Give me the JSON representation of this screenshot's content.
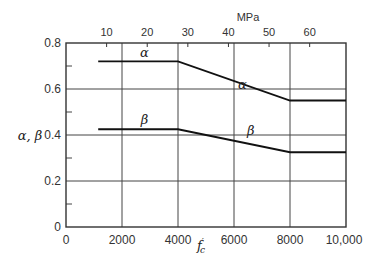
{
  "chart_data": {
    "type": "line",
    "title": "",
    "xlabel": "f'c",
    "ylabel": "α, β",
    "top_axis_label": "MPa",
    "xlim": [
      0,
      10000
    ],
    "ylim": [
      0,
      0.8
    ],
    "grid": true,
    "x_ticks": [
      "0",
      "2000",
      "4000",
      "6000",
      "8000",
      "10,000"
    ],
    "y_ticks": [
      "0",
      "0.2",
      "0.4",
      "0.6",
      "0.8"
    ],
    "top_ticks": [
      "10",
      "20",
      "30",
      "40",
      "50",
      "60"
    ],
    "series": [
      {
        "name": "α",
        "x": [
          1150,
          4000,
          8000,
          10000
        ],
        "y": [
          0.72,
          0.72,
          0.55,
          0.55
        ]
      },
      {
        "name": "β",
        "x": [
          1150,
          4000,
          8000,
          10000
        ],
        "y": [
          0.425,
          0.425,
          0.325,
          0.325
        ]
      }
    ],
    "annotations": [
      {
        "text": "α",
        "x": 2800,
        "y": 0.74
      },
      {
        "text": "α",
        "x": 6300,
        "y": 0.6
      },
      {
        "text": "β",
        "x": 2800,
        "y": 0.45
      },
      {
        "text": "β",
        "x": 6600,
        "y": 0.4
      }
    ]
  }
}
